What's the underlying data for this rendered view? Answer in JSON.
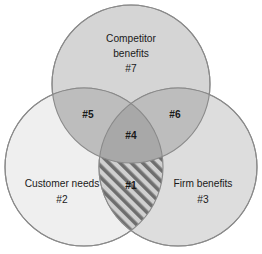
{
  "diagram": {
    "type": "venn-3-circle",
    "background_color": "#ffffff",
    "outline_color": "#8a8a8a",
    "text_color": "#1a1a1a",
    "circles": [
      {
        "id": "competitor",
        "title_line1": "Competitor",
        "title_line2": "benefits",
        "code": "#7",
        "fill_color": "#d5d5d5",
        "cx": 131,
        "cy": 84,
        "r": 79
      },
      {
        "id": "customer",
        "title_line1": "Customer needs",
        "title_line2": "",
        "code": "#2",
        "fill_color": "#eeeeee",
        "cx": 84,
        "cy": 167,
        "r": 79
      },
      {
        "id": "firm",
        "title_line1": "Firm benefits",
        "title_line2": "",
        "code": "#3",
        "fill_color": "#d9d9d9",
        "cx": 178,
        "cy": 167,
        "r": 79
      }
    ],
    "intersections": [
      {
        "id": "competitor-customer",
        "code": "#5",
        "fill_color": "#bdbdbd",
        "x": 88,
        "y": 115
      },
      {
        "id": "competitor-firm",
        "code": "#6",
        "fill_color": "#bdbdbd",
        "x": 175,
        "y": 115
      },
      {
        "id": "all-three",
        "code": "#4",
        "fill_color": "#a8a8a8",
        "x": 131,
        "y": 136
      },
      {
        "id": "customer-firm",
        "code": "#1",
        "fill_color": "#d0d0d0",
        "hatch": "diagonal-stripes",
        "hatch_color": "#6e6e6e",
        "x": 131,
        "y": 186
      }
    ]
  }
}
